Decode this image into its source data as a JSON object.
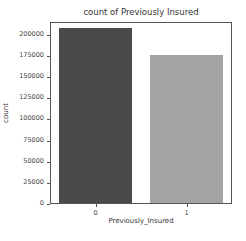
{
  "chart_data": {
    "type": "bar",
    "title": "count of Previously Insured",
    "xlabel": "Previously_Insured",
    "ylabel": "count",
    "categories": [
      "0",
      "1"
    ],
    "values": [
      206481,
      174628
    ],
    "colors": [
      "#4a4a4a",
      "#a3a3a3"
    ],
    "ylim": [
      0,
      215000
    ],
    "yticks": [
      0,
      25000,
      50000,
      75000,
      100000,
      125000,
      150000,
      175000,
      200000
    ],
    "ytick_labels": [
      "0",
      "25000",
      "50000",
      "75000",
      "100000",
      "125000",
      "150000",
      "175000",
      "200000"
    ],
    "grid": false,
    "legend": null
  }
}
